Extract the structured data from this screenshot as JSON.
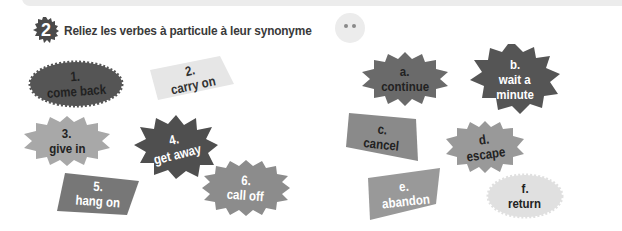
{
  "exercise": {
    "number": "2",
    "title": "Reliez les verbes à particule à leur synonyme"
  },
  "colors": {
    "badge": "#4a4a4a",
    "title_text": "#3a3a3a",
    "dark_gray": "#555555",
    "mid_gray": "#8c8c8c",
    "light_gray": "#a8a8a8",
    "pale_gray": "#e4e4e4"
  },
  "phrasal_verbs": [
    {
      "num": "1.",
      "text": "come back"
    },
    {
      "num": "2.",
      "text": "carry on"
    },
    {
      "num": "3.",
      "text": "give in"
    },
    {
      "num": "4.",
      "text": "get away"
    },
    {
      "num": "5.",
      "text": "hang on"
    },
    {
      "num": "6.",
      "text": "call off"
    }
  ],
  "synonyms": [
    {
      "letter": "a.",
      "text": "continue"
    },
    {
      "letter": "b.",
      "text": "wait a",
      "text2": "minute"
    },
    {
      "letter": "c.",
      "text": "cancel"
    },
    {
      "letter": "d.",
      "text": "escape"
    },
    {
      "letter": "e.",
      "text": "abandon"
    },
    {
      "letter": "f.",
      "text": "return"
    }
  ]
}
